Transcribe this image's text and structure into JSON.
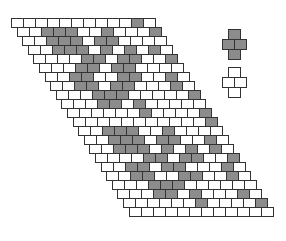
{
  "diagram": {
    "type": "slanted-brick-grid",
    "columns": 12,
    "origin": {
      "x": 11,
      "y": 18
    },
    "cell": {
      "w": 12,
      "h": 9
    },
    "row_shift_x": 5.6,
    "colors": {
      "filled": "#8c8c8c",
      "empty": "#ffffff",
      "stroke": "#333333"
    },
    "rows": [
      [
        0,
        0,
        0,
        0,
        0,
        0,
        0,
        0,
        0,
        0,
        1,
        0
      ],
      [
        0,
        0,
        1,
        1,
        1,
        0,
        0,
        1,
        0,
        0,
        0,
        1
      ],
      [
        0,
        0,
        1,
        1,
        1,
        0,
        1,
        1,
        0,
        0,
        0,
        0
      ],
      [
        0,
        0,
        1,
        1,
        1,
        0,
        1,
        0,
        1,
        0,
        1,
        0
      ],
      [
        0,
        0,
        0,
        0,
        1,
        1,
        0,
        1,
        1,
        0,
        0,
        1
      ],
      [
        0,
        0,
        0,
        1,
        1,
        0,
        1,
        1,
        0,
        0,
        0,
        0
      ],
      [
        0,
        0,
        1,
        1,
        0,
        0,
        1,
        1,
        0,
        0,
        1,
        0
      ],
      [
        0,
        0,
        1,
        1,
        0,
        1,
        1,
        0,
        0,
        0,
        1,
        0
      ],
      [
        0,
        0,
        0,
        1,
        1,
        1,
        0,
        0,
        0,
        0,
        0,
        1
      ],
      [
        0,
        0,
        0,
        1,
        1,
        0,
        1,
        0,
        0,
        0,
        0,
        0
      ],
      [
        0,
        0,
        0,
        0,
        0,
        0,
        1,
        0,
        0,
        0,
        0,
        1
      ],
      [
        0,
        0,
        0,
        0,
        0,
        0,
        0,
        0,
        0,
        0,
        0,
        1
      ],
      [
        0,
        0,
        1,
        1,
        1,
        0,
        0,
        1,
        0,
        0,
        0,
        0
      ],
      [
        0,
        0,
        1,
        1,
        1,
        0,
        1,
        1,
        0,
        0,
        1,
        0
      ],
      [
        0,
        0,
        1,
        1,
        1,
        0,
        1,
        0,
        1,
        0,
        1,
        0
      ],
      [
        0,
        0,
        0,
        0,
        1,
        1,
        0,
        1,
        1,
        0,
        0,
        1
      ],
      [
        0,
        0,
        1,
        1,
        0,
        1,
        1,
        0,
        0,
        0,
        1,
        0
      ],
      [
        0,
        0,
        1,
        1,
        0,
        0,
        1,
        1,
        0,
        0,
        1,
        0
      ],
      [
        0,
        0,
        0,
        1,
        1,
        1,
        0,
        0,
        0,
        0,
        0,
        0
      ],
      [
        0,
        0,
        0,
        1,
        1,
        0,
        1,
        0,
        0,
        0,
        1,
        0
      ],
      [
        0,
        0,
        0,
        0,
        0,
        0,
        1,
        0,
        0,
        0,
        0,
        1
      ],
      [
        0,
        0,
        0,
        0,
        0,
        0,
        0,
        0,
        0,
        0,
        0,
        0
      ]
    ],
    "legend": [
      {
        "name": "filled-cross",
        "fill": "filled",
        "x": 222,
        "y": 29
      },
      {
        "name": "empty-cross",
        "fill": "empty",
        "x": 222,
        "y": 67
      }
    ]
  }
}
